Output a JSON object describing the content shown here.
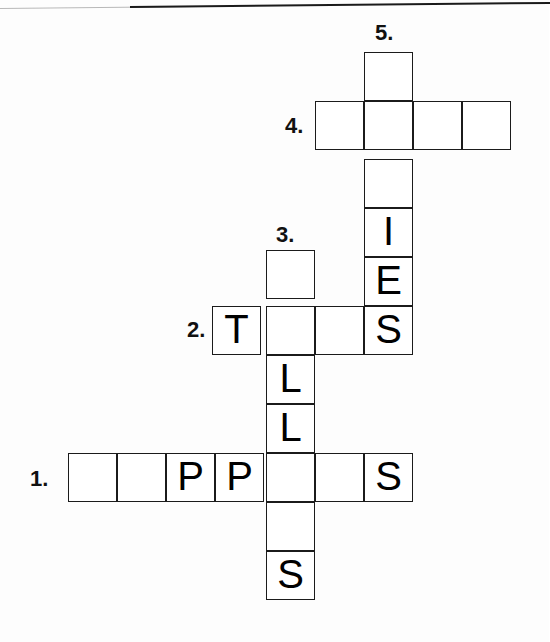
{
  "puzzle": {
    "title": "Crossword Puzzle Grid",
    "cell_size": 49,
    "line_color": "#1b1b1b",
    "cell_fill": "#ffffff",
    "text_color": "#000000",
    "clue_numbers": [
      {
        "label": "1.",
        "x": 30,
        "y": 468,
        "for_entry": "across-1"
      },
      {
        "label": "2.",
        "x": 187,
        "y": 319,
        "for_entry": "across-2"
      },
      {
        "label": "3.",
        "x": 276,
        "y": 224,
        "for_entry": "down-3"
      },
      {
        "label": "4.",
        "x": 285,
        "y": 115,
        "for_entry": "across-4"
      },
      {
        "label": "5.",
        "x": 375,
        "y": 22,
        "for_entry": "down-5"
      }
    ],
    "entries": [
      {
        "id": "across-1",
        "number": "1.",
        "direction": "across",
        "length": 7,
        "letters": [
          "",
          "",
          "P",
          "P",
          "",
          "",
          "S"
        ]
      },
      {
        "id": "across-2",
        "number": "2.",
        "direction": "across",
        "length": 4,
        "letters": [
          "T",
          "",
          "",
          "S"
        ]
      },
      {
        "id": "down-3",
        "number": "3.",
        "direction": "down",
        "length": 7,
        "letters": [
          "",
          "",
          "L",
          "L",
          "",
          "",
          "S"
        ]
      },
      {
        "id": "across-4",
        "number": "4.",
        "direction": "across",
        "length": 4,
        "letters": [
          "",
          "",
          "",
          ""
        ]
      },
      {
        "id": "down-5",
        "number": "5.",
        "direction": "down",
        "length": 6,
        "letters": [
          "",
          "",
          "",
          "I",
          "E",
          "S"
        ]
      }
    ],
    "cells": [
      {
        "id": "c5-r1",
        "entry": "down-5",
        "index": 0,
        "x": 364,
        "y": 52,
        "letter": ""
      },
      {
        "id": "c5-r2",
        "entry": "down-5",
        "index": 1,
        "x": 364,
        "y": 101,
        "letter": ""
      },
      {
        "id": "c5-r3",
        "entry": "down-5",
        "index": 2,
        "x": 364,
        "y": 159,
        "letter": ""
      },
      {
        "id": "c5-r4",
        "entry": "down-5",
        "index": 3,
        "x": 364,
        "y": 208,
        "letter": "I"
      },
      {
        "id": "c5-r5",
        "entry": "down-5",
        "index": 4,
        "x": 364,
        "y": 257,
        "letter": "E"
      },
      {
        "id": "c5-r6",
        "entry": "down-5",
        "index": 5,
        "x": 364,
        "y": 306,
        "letter": "S"
      },
      {
        "id": "c4-a",
        "entry": "across-4",
        "index": 0,
        "x": 315,
        "y": 101,
        "letter": ""
      },
      {
        "id": "c4-b",
        "entry": "across-4",
        "index": 1,
        "x": 364,
        "y": 101,
        "letter": ""
      },
      {
        "id": "c4-c",
        "entry": "across-4",
        "index": 2,
        "x": 413,
        "y": 101,
        "letter": ""
      },
      {
        "id": "c4-d",
        "entry": "across-4",
        "index": 3,
        "x": 462,
        "y": 101,
        "letter": ""
      },
      {
        "id": "c3-r1",
        "entry": "down-3",
        "index": 0,
        "x": 266,
        "y": 250,
        "letter": ""
      },
      {
        "id": "c3-r2",
        "entry": "down-3",
        "index": 1,
        "x": 266,
        "y": 306,
        "letter": ""
      },
      {
        "id": "c3-r3",
        "entry": "down-3",
        "index": 2,
        "x": 266,
        "y": 355,
        "letter": "L"
      },
      {
        "id": "c3-r4",
        "entry": "down-3",
        "index": 3,
        "x": 266,
        "y": 404,
        "letter": "L"
      },
      {
        "id": "c3-r5",
        "entry": "down-3",
        "index": 4,
        "x": 266,
        "y": 453,
        "letter": ""
      },
      {
        "id": "c3-r6",
        "entry": "down-3",
        "index": 5,
        "x": 266,
        "y": 502,
        "letter": ""
      },
      {
        "id": "c3-r7",
        "entry": "down-3",
        "index": 6,
        "x": 266,
        "y": 551,
        "letter": "S"
      },
      {
        "id": "c2-a",
        "entry": "across-2",
        "index": 0,
        "x": 212,
        "y": 306,
        "letter": "T"
      },
      {
        "id": "c2-b",
        "entry": "across-2",
        "index": 1,
        "x": 266,
        "y": 306,
        "letter": ""
      },
      {
        "id": "c2-c",
        "entry": "across-2",
        "index": 2,
        "x": 315,
        "y": 306,
        "letter": ""
      },
      {
        "id": "c2-d",
        "entry": "across-2",
        "index": 3,
        "x": 364,
        "y": 306,
        "letter": "S"
      },
      {
        "id": "c1-a",
        "entry": "across-1",
        "index": 0,
        "x": 68,
        "y": 453,
        "letter": ""
      },
      {
        "id": "c1-b",
        "entry": "across-1",
        "index": 1,
        "x": 117,
        "y": 453,
        "letter": ""
      },
      {
        "id": "c1-c",
        "entry": "across-1",
        "index": 2,
        "x": 166,
        "y": 453,
        "letter": "P"
      },
      {
        "id": "c1-d",
        "entry": "across-1",
        "index": 3,
        "x": 215,
        "y": 453,
        "letter": "P"
      },
      {
        "id": "c1-e",
        "entry": "across-1",
        "index": 4,
        "x": 266,
        "y": 453,
        "letter": ""
      },
      {
        "id": "c1-f",
        "entry": "across-1",
        "index": 5,
        "x": 315,
        "y": 453,
        "letter": ""
      },
      {
        "id": "c1-g",
        "entry": "across-1",
        "index": 6,
        "x": 364,
        "y": 453,
        "letter": "S"
      }
    ]
  }
}
